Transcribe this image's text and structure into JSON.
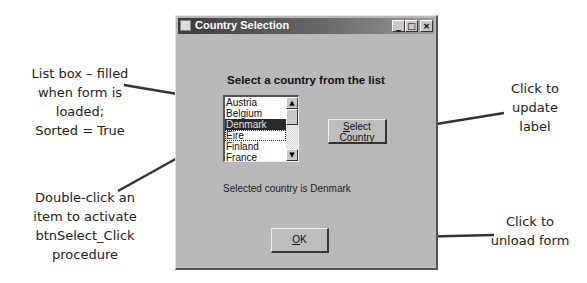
{
  "window": {
    "title": "Country Selection",
    "controls": {
      "minimize": "_",
      "maximize": "□",
      "close": "×"
    },
    "heading": "Select a country from the list",
    "listbox": {
      "items": [
        "Austria",
        "Belgium",
        "Denmark",
        "Eire",
        "Finland",
        "France"
      ],
      "selected_index": 2,
      "focused_index": 3,
      "scroll_up": "▲",
      "scroll_down": "▼"
    },
    "select_button": {
      "line1_accel": "S",
      "line1_rest": "elect",
      "line2": "Country"
    },
    "status_label": "Selected country is Denmark",
    "ok_button": {
      "accel": "O",
      "rest": "K"
    }
  },
  "annotations": {
    "listbox_note": [
      "List box – filled",
      "when form is",
      "loaded;",
      "Sorted = True"
    ],
    "doubleclick_note": [
      "Double-click  an",
      "item to activate",
      "btnSelect_Click",
      "procedure"
    ],
    "select_note": [
      "Click to",
      "update",
      "label"
    ],
    "ok_note": [
      "Click to",
      "unload form"
    ]
  },
  "colors": {
    "form_background": "#b9b9b9",
    "titlebar_dark": "#3c3c3c",
    "selection": "#2a2a2a",
    "callout_line": "#333333"
  }
}
